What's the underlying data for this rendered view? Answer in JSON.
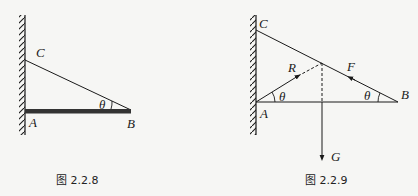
{
  "figures": [
    {
      "id": "fig-2-2-8",
      "caption": "图 2.2.8",
      "labels": {
        "C": "C",
        "A": "A",
        "B": "B",
        "theta": "θ"
      }
    },
    {
      "id": "fig-2-2-9",
      "caption": "图 2.2.9",
      "labels": {
        "C": "C",
        "A": "A",
        "B": "B",
        "theta_A": "θ",
        "theta_B": "θ",
        "R": "R",
        "F": "F",
        "G": "G"
      }
    }
  ],
  "colors": {
    "line": "#1a1a1a",
    "rod": "#333333",
    "background": "#f6f6f4"
  }
}
